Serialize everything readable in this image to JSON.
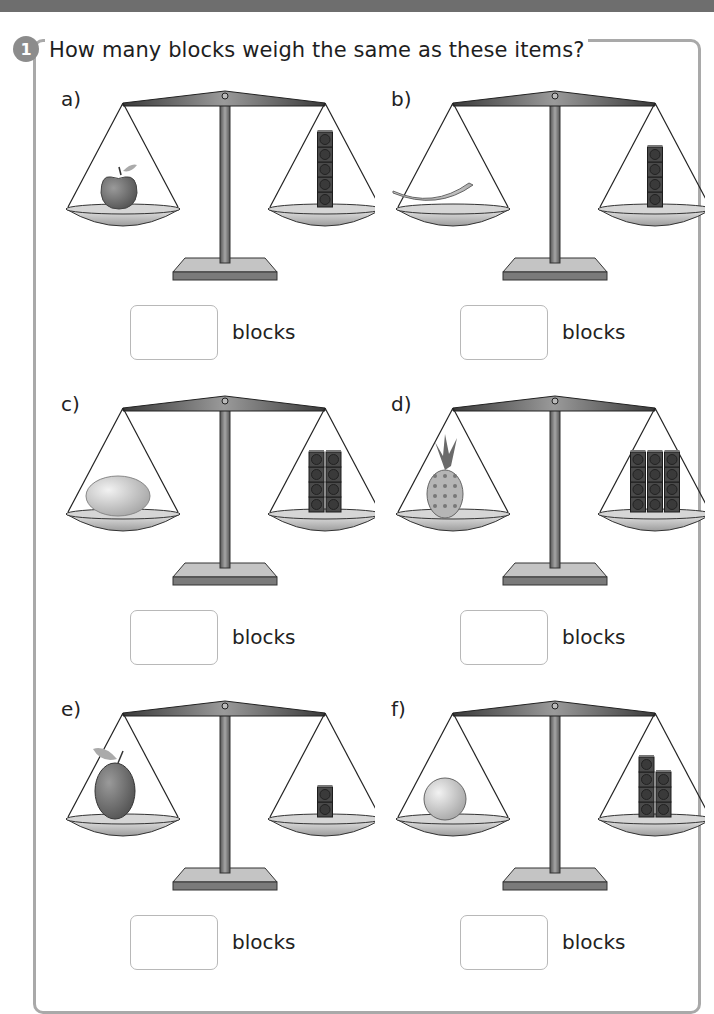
{
  "question": {
    "number": "1",
    "text": "How many blocks weigh the same as these items?"
  },
  "items": [
    {
      "label": "a)",
      "item": "apple",
      "block_columns": [
        5
      ],
      "blocks_shown": 5,
      "answer_value": "",
      "unit": "blocks"
    },
    {
      "label": "b)",
      "item": "banana",
      "block_columns": [
        4
      ],
      "blocks_shown": 4,
      "answer_value": "",
      "unit": "blocks"
    },
    {
      "label": "c)",
      "item": "potato",
      "block_columns": [
        4,
        4
      ],
      "blocks_shown": 8,
      "answer_value": "",
      "unit": "blocks"
    },
    {
      "label": "d)",
      "item": "pineapple",
      "block_columns": [
        4,
        4,
        4
      ],
      "blocks_shown": 12,
      "answer_value": "",
      "unit": "blocks"
    },
    {
      "label": "e)",
      "item": "plum",
      "block_columns": [
        2
      ],
      "blocks_shown": 2,
      "answer_value": "",
      "unit": "blocks"
    },
    {
      "label": "f)",
      "item": "orange",
      "block_columns": [
        4,
        3
      ],
      "blocks_shown": 7,
      "answer_value": "",
      "unit": "blocks"
    }
  ],
  "colors": {
    "top_strip": "#6e6e6e",
    "frame_border": "#a9a9a9",
    "badge": "#8c8c8c",
    "answer_box_border": "#b8b8b8",
    "block": "#4a4a4a"
  }
}
